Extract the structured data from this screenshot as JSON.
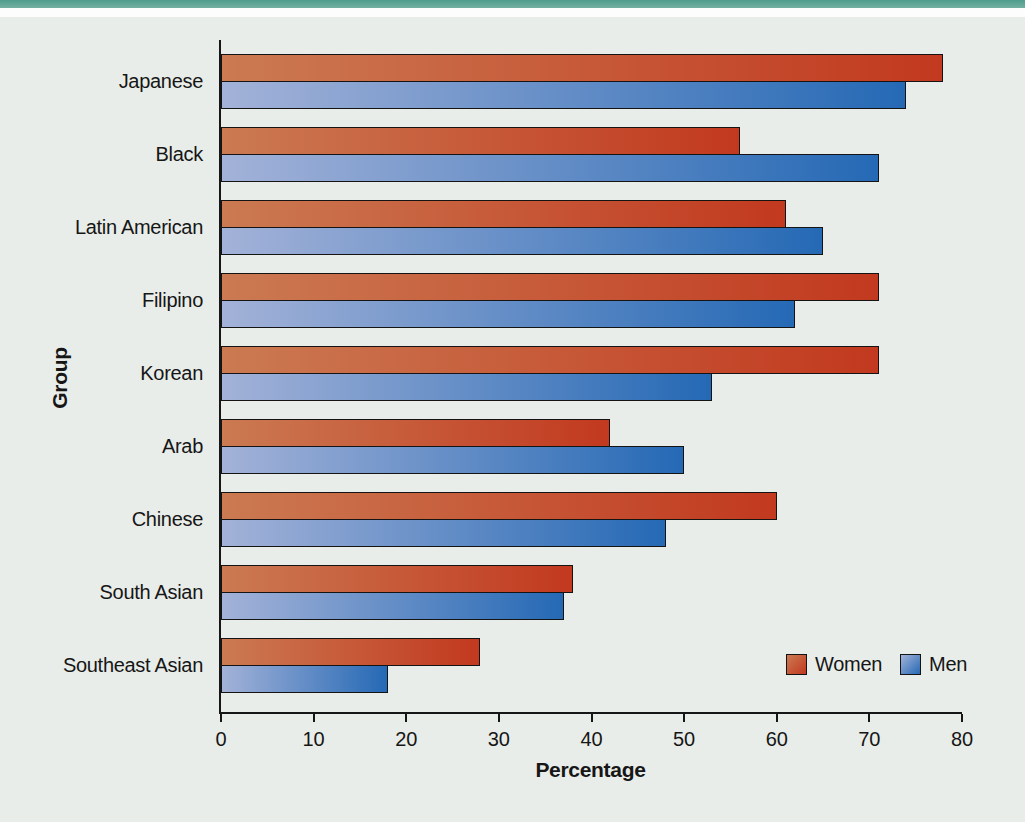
{
  "page": {
    "top_band_color": "#5ea496",
    "background_color": "#e9ede9",
    "axis_color": "#161616"
  },
  "chart_data": {
    "type": "bar",
    "orientation": "horizontal",
    "xlabel": "Percentage",
    "ylabel": "Group",
    "xlim": [
      0,
      80
    ],
    "xticks": [
      0,
      10,
      20,
      30,
      40,
      50,
      60,
      70,
      80
    ],
    "grid": false,
    "legend_position": "inside-bottom-right",
    "categories": [
      "Japanese",
      "Black",
      "Latin American",
      "Filipino",
      "Korean",
      "Arab",
      "Chinese",
      "South Asian",
      "Southeast Asian"
    ],
    "series": [
      {
        "name": "Women",
        "color_start": "#cb7a52",
        "color_end": "#c2391f",
        "values": [
          78,
          56,
          61,
          71,
          71,
          42,
          60,
          38,
          28
        ]
      },
      {
        "name": "Men",
        "color_start": "#a3b2d8",
        "color_end": "#2569b5",
        "values": [
          74,
          71,
          65,
          62,
          53,
          50,
          48,
          37,
          18
        ]
      }
    ]
  }
}
